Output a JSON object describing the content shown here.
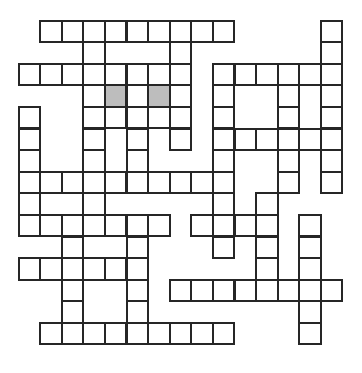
{
  "puzzle": {
    "type": "crossword",
    "columns": 15,
    "rows": 15,
    "cell_size": 21.6,
    "origin": [
      17.5,
      19.5
    ],
    "colors": {
      "line": "#262626",
      "cell": "#ffffff",
      "shaded": "#bdbdbd",
      "background": "#ffffff"
    },
    "row_cells": [
      [
        1,
        2,
        3,
        4,
        5,
        6,
        7,
        8,
        9,
        14
      ],
      [
        3,
        7,
        14
      ],
      [
        0,
        1,
        2,
        3,
        4,
        5,
        6,
        7,
        9,
        10,
        11,
        12,
        13,
        14
      ],
      [
        3,
        4,
        5,
        6,
        7,
        9,
        12,
        14
      ],
      [
        0,
        3,
        4,
        5,
        6,
        7,
        9,
        12,
        14
      ],
      [
        0,
        3,
        5,
        7,
        9,
        10,
        11,
        12,
        13,
        14
      ],
      [
        0,
        3,
        5,
        9,
        12,
        14
      ],
      [
        0,
        1,
        2,
        3,
        4,
        5,
        6,
        7,
        8,
        9,
        12,
        14
      ],
      [
        0,
        3,
        9,
        11
      ],
      [
        0,
        1,
        2,
        3,
        4,
        5,
        6,
        8,
        9,
        10,
        11,
        13
      ],
      [
        2,
        5,
        9,
        11,
        13
      ],
      [
        0,
        1,
        2,
        3,
        4,
        5,
        11,
        13
      ],
      [
        2,
        5,
        7,
        8,
        9,
        10,
        11,
        12,
        13,
        14
      ],
      [
        2,
        5,
        13
      ],
      [
        1,
        2,
        3,
        4,
        5,
        6,
        7,
        8,
        9,
        13
      ]
    ],
    "shaded_cells": [
      [
        3,
        4
      ],
      [
        3,
        6
      ]
    ]
  }
}
